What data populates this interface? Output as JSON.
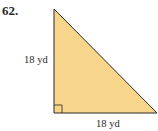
{
  "problem": {
    "number": "62.",
    "shape": "right-triangle",
    "left_side_label": "18 yd",
    "bottom_side_label": "18 yd",
    "fill_color": "#F7D58A",
    "stroke_color": "#2b2b2b"
  }
}
